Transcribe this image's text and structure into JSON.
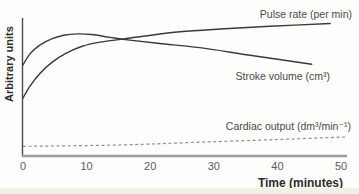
{
  "figure": {
    "background": "#fdfdfb",
    "bottom_band_color": "#f1f0e7"
  },
  "chart_data": {
    "type": "line",
    "title": "",
    "xlabel": "Time (minutes)",
    "ylabel": "Arbitrary units",
    "x_ticks": [
      0,
      10,
      20,
      30,
      40,
      50
    ],
    "x_range": [
      0,
      50
    ],
    "y_range": [
      0,
      100
    ],
    "y_units": "arbitrary units (unlabeled axis)",
    "grid": false,
    "legend_position": "inline-right-of-each-line",
    "axis_color": "#9b9b9b",
    "yaxis_color": "#4a4a4a",
    "label_color": "#4a4a4a",
    "tick_color": "#5c5c5c",
    "series": [
      {
        "name": "Pulse rate (per min)",
        "style": "solid",
        "color": "#3a3a3a",
        "points": [
          [
            0,
            42
          ],
          [
            1.1,
            50.7
          ],
          [
            2.7,
            60
          ],
          [
            4.6,
            68
          ],
          [
            6.8,
            74.5
          ],
          [
            9.3,
            79.5
          ],
          [
            12.1,
            82.5
          ],
          [
            15.3,
            84.5
          ],
          [
            19.2,
            87
          ],
          [
            24.7,
            90
          ],
          [
            31,
            92
          ],
          [
            38.8,
            94
          ],
          [
            48.3,
            96
          ]
        ]
      },
      {
        "name": "Stroke volume (cm³)",
        "style": "solid",
        "color": "#3a3a3a",
        "points": [
          [
            0,
            66
          ],
          [
            1.1,
            74
          ],
          [
            2.7,
            80.5
          ],
          [
            4.6,
            85
          ],
          [
            6.4,
            87.5
          ],
          [
            8.6,
            88.5
          ],
          [
            10.8,
            88
          ],
          [
            13.7,
            86
          ],
          [
            16.8,
            84
          ],
          [
            21.5,
            81.5
          ],
          [
            27.8,
            78.5
          ],
          [
            35.7,
            73
          ],
          [
            45.4,
            66.5
          ]
        ]
      },
      {
        "name": "Cardiac output (dm³/min⁻¹)",
        "style": "dashed",
        "color": "#8f8f8f",
        "points": [
          [
            0,
            7
          ],
          [
            15.3,
            8
          ],
          [
            27.8,
            10
          ],
          [
            40.4,
            12
          ],
          [
            50.9,
            13.8
          ]
        ]
      }
    ],
    "annotations": [
      "Pulse rate and stroke volume curves cross at about 15 minutes",
      "Stroke volume peaks at about 8-10 minutes then gradually declines",
      "Cardiac output rises slowly and steadily along the bottom"
    ]
  }
}
